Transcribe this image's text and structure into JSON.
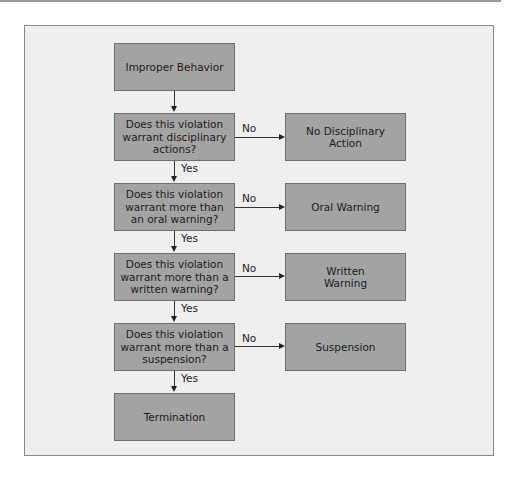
{
  "flowchart": {
    "start": "Improper Behavior",
    "decisions": [
      {
        "question": "Does this violation warrant disciplinary actions?",
        "no_outcome": "No Disciplinary Action"
      },
      {
        "question": "Does this violation warrant more than an oral warning?",
        "no_outcome": "Oral Warning"
      },
      {
        "question": "Does this violation warrant more than a written warning?",
        "no_outcome": "Written Warning"
      },
      {
        "question": "Does this violation warrant more than a suspension?",
        "no_outcome": "Suspension"
      }
    ],
    "end": "Termination",
    "yes_label": "Yes",
    "no_label": "No"
  },
  "colors": {
    "box_fill": "#a3a3a3",
    "panel_fill": "#efefee",
    "border": "#8a8a8a"
  }
}
